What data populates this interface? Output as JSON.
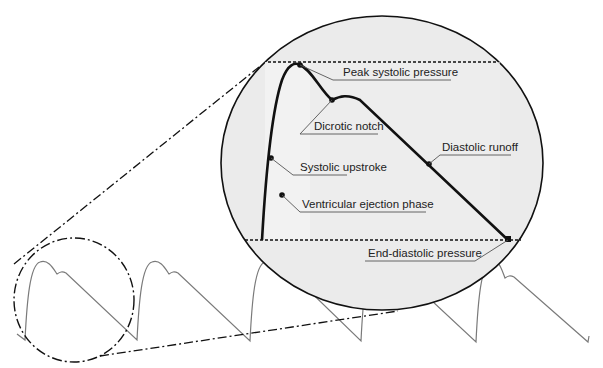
{
  "diagram": {
    "colors": {
      "background": "#ffffff",
      "magnifier_fill": "#ececec",
      "magnifier_inner_fill": "#f3f3f3",
      "waveform_thin": "#777777",
      "waveform_bold": "#111111",
      "outline": "#111111",
      "leader": "#555555"
    },
    "labels": {
      "peak_systolic": "Peak systolic pressure",
      "dicrotic_notch": "Dicrotic notch",
      "systolic_upstroke": "Systolic upstroke",
      "diastolic_runoff": "Diastolic runoff",
      "ventricular_ejection": "Ventricular ejection phase",
      "end_diastolic": "End-diastolic pressure"
    },
    "elements": {
      "magnifier": "Magnified view of one pressure cycle",
      "focus_circle": "Dash-dot circle highlighting first cycle",
      "waveform": "Repeating arterial pressure trace (5 cycles)"
    }
  }
}
